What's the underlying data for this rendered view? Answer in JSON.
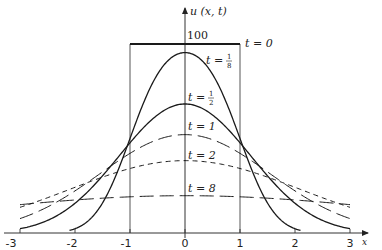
{
  "chart_data": {
    "type": "line",
    "title": "",
    "xlabel": "x",
    "ylabel": "u(x, t)",
    "xlim": [
      -3,
      3
    ],
    "ylim": [
      0,
      100
    ],
    "x_ticks": [
      "-3",
      "-2",
      "-1",
      "0",
      "1",
      "2",
      "3"
    ],
    "y_tick_labels": [
      "100"
    ],
    "grid": false,
    "legend": "inline labels",
    "initial_condition": "u = 100 for |x| < 1, 0 otherwise",
    "series": [
      {
        "name": "t = 0",
        "t": 0,
        "style": "solid-thick",
        "x": [
          -1,
          -1,
          1,
          1
        ],
        "values": [
          0,
          100,
          100,
          0
        ]
      },
      {
        "name": "t = 1/8",
        "t": 0.125,
        "style": "solid",
        "x": [
          -2,
          -1.5,
          -1,
          -0.5,
          0,
          0.5,
          1,
          1.5,
          2
        ],
        "values": [
          2,
          16,
          48,
          84,
          95,
          84,
          48,
          16,
          2
        ]
      },
      {
        "name": "t = 1/2",
        "t": 0.5,
        "style": "solid",
        "x": [
          -3,
          -2,
          -1,
          -0.5,
          0,
          0.5,
          1,
          2,
          3
        ],
        "values": [
          2,
          16,
          48,
          61,
          68,
          61,
          48,
          16,
          2
        ]
      },
      {
        "name": "t = 1",
        "t": 1,
        "style": "long-dash",
        "x": [
          -3,
          -2,
          -1,
          0,
          1,
          2,
          3
        ],
        "values": [
          8,
          24,
          42,
          52,
          42,
          24,
          8
        ]
      },
      {
        "name": "t = 2",
        "t": 2,
        "style": "short-dash",
        "x": [
          -3,
          -2,
          -1,
          0,
          1,
          2,
          3
        ],
        "values": [
          16,
          26,
          34,
          38,
          34,
          26,
          16
        ]
      },
      {
        "name": "t = 8",
        "t": 8,
        "style": "long-dash",
        "x": [
          -3,
          -2,
          -1,
          0,
          1,
          2,
          3
        ],
        "values": [
          16,
          18,
          19,
          20,
          19,
          18,
          16
        ]
      }
    ],
    "labels": {
      "y_axis": "u (x, t)",
      "x_axis": "x",
      "top_value": "100",
      "t0": "t = 0",
      "t18_prefix": "t = ",
      "t18_num": "1",
      "t18_den": "8",
      "t12_prefix": "t = ",
      "t12_num": "1",
      "t12_den": "2",
      "t1": "t = 1",
      "t2": "t = 2",
      "t8": "t = 8"
    }
  }
}
